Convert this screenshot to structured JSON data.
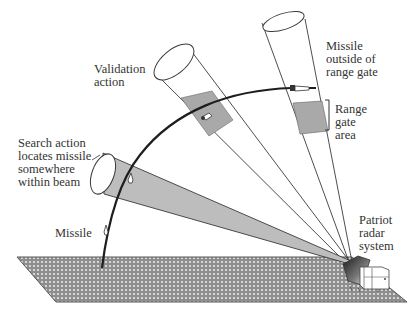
{
  "figure": {
    "type": "radar-engagement-diagram",
    "colors": {
      "background": "#ffffff",
      "line": "#3a3a3a",
      "beam_shade": "#bdbdbd",
      "range_gate_shade": "#a9a9a9",
      "ground": "#8c8c8c",
      "text": "#333333"
    }
  },
  "labels": {
    "validation_action": "Validation\naction",
    "search_action": "Search action\nlocates missile\nsomewhere\nwithin beam",
    "missile": "Missile",
    "missile_outside": "Missile\noutside of\nrange gate",
    "range_gate_area": "Range\ngate\narea",
    "patriot_radar": "Patriot\nradar\nsystem"
  },
  "elements": {
    "beams": [
      {
        "name": "search-beam",
        "description": "shaded beam, missile located somewhere within beam"
      },
      {
        "name": "validation-beam",
        "description": "beam with shaded range gate containing missile"
      },
      {
        "name": "range-gate-beam",
        "description": "beam with shaded range gate; missile outside of gate"
      }
    ],
    "trajectory": "missile flight path from ground launch curving upward to the right",
    "ground": "textured ground plane",
    "radar": "Patriot radar system at right end of ground plane"
  }
}
